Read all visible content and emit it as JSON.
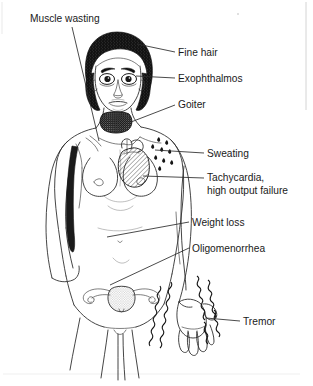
{
  "figure": {
    "line_art_color": "#303030",
    "background_color": "#ffffff",
    "text_color": "#1a1a1a"
  },
  "annotations": [
    {
      "id": "muscle-wasting",
      "label": "Muscle wasting",
      "label_x": 30,
      "label_y": 22,
      "anchor": "start",
      "target": "shoulder-upper-arm-muscle",
      "leader": "M 72,27 L 99,141"
    },
    {
      "id": "fine-hair",
      "label": "Fine hair",
      "label_x": 178,
      "label_y": 56,
      "anchor": "start",
      "target": "scalp-hair",
      "leader": "M 175,52 L 137,44"
    },
    {
      "id": "exophthalmos",
      "label": "Exophthalmos",
      "label_x": 178,
      "label_y": 82,
      "anchor": "start",
      "target": "eyes",
      "leader": "M 175,78 L 136,76"
    },
    {
      "id": "goiter",
      "label": "Goiter",
      "label_x": 178,
      "label_y": 108,
      "anchor": "start",
      "target": "thyroid-gland",
      "leader": "M 175,105 L 131,122"
    },
    {
      "id": "sweating",
      "label": "Sweating",
      "label_x": 207,
      "label_y": 157,
      "anchor": "start",
      "target": "sweat-droplets-chest",
      "leader": "M 204,153 L 155,150"
    },
    {
      "id": "tachycardia",
      "label": "Tachycardia,",
      "label_line2": "high output failure",
      "label_x": 207,
      "label_y": 181,
      "label2_y": 194,
      "anchor": "start",
      "target": "heart",
      "leader": "M 204,178 L 143,176"
    },
    {
      "id": "weight-loss",
      "label": "Weight loss",
      "label_x": 192,
      "label_y": 226,
      "anchor": "start",
      "target": "abdomen",
      "leader": "M 189,222 L 107,237"
    },
    {
      "id": "oligomenorrhea",
      "label": "Oligomenorrhea",
      "label_x": 192,
      "label_y": 252,
      "anchor": "start",
      "target": "uterus",
      "leader": "M 189,248 L 110,285"
    },
    {
      "id": "tremor",
      "label": "Tremor",
      "label_x": 243,
      "label_y": 325,
      "anchor": "start",
      "target": "hand-tremor-lines",
      "leader": "M 240,321 L 206,318"
    }
  ],
  "anatomy_parts": [
    {
      "id": "head",
      "name": "head"
    },
    {
      "id": "hair",
      "name": "scalp-hair",
      "shading": "dark-stipple"
    },
    {
      "id": "eyes",
      "name": "eyes",
      "feature": "protruding"
    },
    {
      "id": "nose",
      "name": "nose"
    },
    {
      "id": "mouth",
      "name": "mouth"
    },
    {
      "id": "neck",
      "name": "neck"
    },
    {
      "id": "thyroid",
      "name": "thyroid-gland-goiter",
      "shading": "dark-stipple"
    },
    {
      "id": "torso",
      "name": "torso"
    },
    {
      "id": "breasts",
      "name": "breasts"
    },
    {
      "id": "heart",
      "name": "heart",
      "shading": "diagonal-hatch"
    },
    {
      "id": "sweat",
      "name": "sweat-droplets",
      "count": 9
    },
    {
      "id": "right-arm",
      "name": "raised-arm-with-wasted-muscle",
      "shading": "dark-fill"
    },
    {
      "id": "left-arm",
      "name": "hanging-arm-with-tremor"
    },
    {
      "id": "hand",
      "name": "hand"
    },
    {
      "id": "tremor-lines",
      "name": "tremor-squiggle-lines",
      "count": 6
    },
    {
      "id": "uterus",
      "name": "uterus-with-fallopian-tubes-and-ovaries",
      "shading": "fine-stipple"
    },
    {
      "id": "legs",
      "name": "legs"
    }
  ]
}
